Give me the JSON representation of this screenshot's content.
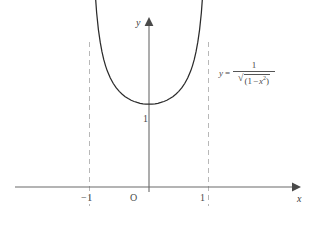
{
  "figure": {
    "background_color": "#ffffff",
    "axis_color": "#5a5a5a",
    "curve_color": "#2b2b2b",
    "asymptote_color": "#b8b8b8",
    "label_color": "#3a3a3a"
  },
  "axes": {
    "x_axis_label": "x",
    "y_axis_label": "y",
    "origin_label": "O"
  },
  "ticks": {
    "x_left": "−1",
    "x_right": "1",
    "y_one": "1"
  },
  "equation": {
    "lhs": "y",
    "equals": "=",
    "numerator": "1",
    "radical_sign": "√",
    "radicand_open": "(1",
    "radicand_minus": "−",
    "radicand_var": "x",
    "radicand_exp": "2",
    "radicand_close": ")",
    "plain_text": "y = 1/√(1 − x²)"
  },
  "chart_data": {
    "type": "line",
    "title": "",
    "xlabel": "x",
    "ylabel": "y",
    "function": "y = 1/sqrt(1 - x^2)",
    "domain": [
      -1,
      1
    ],
    "xlim": [
      -1.55,
      1.75
    ],
    "ylim": [
      -0.35,
      3.3
    ],
    "grid": false,
    "legend": null,
    "asymptotes": {
      "type": "vertical",
      "x": [
        -1,
        1
      ],
      "style": "dashed",
      "color": "#b8b8b8"
    },
    "annotations": [
      {
        "text": "y = 1/√(1 − x²)",
        "x": 1.35,
        "y": 2.45
      },
      {
        "text": "1",
        "x": -0.1,
        "y": 1.18
      },
      {
        "text": "O",
        "x": -0.17,
        "y": -0.22
      },
      {
        "text": "−1",
        "x": -1.08,
        "y": -0.22
      },
      {
        "text": "1",
        "x": 0.92,
        "y": -0.22
      }
    ],
    "xticks": [
      -1,
      0,
      1
    ],
    "xticklabels": [
      "−1",
      "O",
      "1"
    ],
    "yticks": [
      1
    ],
    "yticklabels": [
      "1"
    ],
    "minimum_point": {
      "x": 0,
      "y": 1
    },
    "x": [
      -0.905,
      -0.88,
      -0.85,
      -0.82,
      -0.79,
      -0.76,
      -0.73,
      -0.7,
      -0.65,
      -0.6,
      -0.55,
      -0.5,
      -0.45,
      -0.4,
      -0.35,
      -0.3,
      -0.25,
      -0.2,
      -0.15,
      -0.1,
      -0.05,
      0.0,
      0.05,
      0.1,
      0.15,
      0.2,
      0.25,
      0.3,
      0.35,
      0.4,
      0.45,
      0.5,
      0.55,
      0.6,
      0.65,
      0.7,
      0.73,
      0.76,
      0.79,
      0.82,
      0.85,
      0.88,
      0.905
    ],
    "y": [
      2.35,
      2.105,
      1.898,
      1.749,
      1.631,
      1.538,
      1.463,
      1.4,
      1.316,
      1.25,
      1.197,
      1.155,
      1.12,
      1.091,
      1.068,
      1.048,
      1.033,
      1.021,
      1.011,
      1.005,
      1.001,
      1.0,
      1.001,
      1.005,
      1.011,
      1.021,
      1.033,
      1.048,
      1.068,
      1.091,
      1.12,
      1.155,
      1.197,
      1.25,
      1.316,
      1.4,
      1.463,
      1.538,
      1.631,
      1.749,
      1.898,
      2.105,
      2.35
    ]
  }
}
